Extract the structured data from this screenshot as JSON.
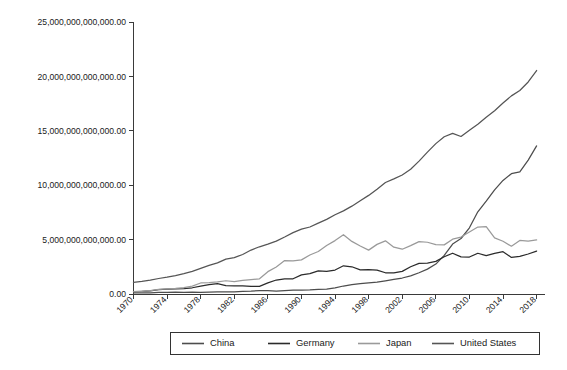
{
  "chart_data": {
    "type": "line",
    "title": "",
    "subtitle": "",
    "xlabel": "",
    "ylabel": "",
    "grid": false,
    "legend_position": "bottom",
    "xlim": [
      1970,
      2019
    ],
    "ylim": [
      0,
      25000000000000
    ],
    "ytick_labels": [
      "0.00",
      "5,000,000,000,000.00",
      "10,000,000,000,000.00",
      "15,000,000,000,000.00",
      "20,000,000,000,000.00",
      "25,000,000,000,000.00"
    ],
    "ytick_values": [
      0,
      5000000000000,
      10000000000000,
      15000000000000,
      20000000000000,
      25000000000000
    ],
    "xtick_labels": [
      "1970",
      "1974",
      "1978",
      "1982",
      "1986",
      "1990",
      "1994",
      "1998",
      "2002",
      "2006",
      "2010",
      "2014",
      "2018"
    ],
    "xtick_values": [
      1970,
      1974,
      1978,
      1982,
      1986,
      1990,
      1994,
      1998,
      2002,
      2006,
      2010,
      2014,
      2018
    ],
    "x": [
      1970,
      1971,
      1972,
      1973,
      1974,
      1975,
      1976,
      1977,
      1978,
      1979,
      1980,
      1981,
      1982,
      1983,
      1984,
      1985,
      1986,
      1987,
      1988,
      1989,
      1990,
      1991,
      1992,
      1993,
      1994,
      1995,
      1996,
      1997,
      1998,
      1999,
      2000,
      2001,
      2002,
      2003,
      2004,
      2005,
      2006,
      2007,
      2008,
      2009,
      2010,
      2011,
      2012,
      2013,
      2014,
      2015,
      2016,
      2017,
      2018
    ],
    "series": [
      {
        "name": "China",
        "color": "#4d4d4d",
        "values": [
          92603000000,
          99800000000,
          113700000000,
          138500000000,
          144200000000,
          163400000000,
          153900000000,
          174900000000,
          149500000000,
          178300000000,
          191100000000,
          195900000000,
          205100000000,
          230700000000,
          259900000000,
          309500000000,
          300800000000,
          272900000000,
          312400000000,
          347800000000,
          360900000000,
          383400000000,
          426900000000,
          444700000000,
          564300000000,
          734500000000,
          863700000000,
          961600000000,
          1029000000000,
          1094000000000,
          1211000000000,
          1339000000000,
          1470000000000,
          1660000000000,
          1955000000000,
          2286000000000,
          2752000000000,
          3550000000000,
          4594000000000,
          5102000000000,
          6087000000000,
          7552000000000,
          8532000000000,
          9570000000000,
          10440000000000,
          11060000000000,
          11230000000000,
          12310000000000,
          13610000000000
        ]
      },
      {
        "name": "Germany",
        "color": "#2b2b2b",
        "values": [
          215800000000,
          250200000000,
          298200000000,
          400300000000,
          446000000000,
          482000000000,
          501500000000,
          573900000000,
          717500000000,
          853100000000,
          946700000000,
          779000000000,
          740600000000,
          738700000000,
          692100000000,
          702000000000,
          1016000000000,
          1284000000000,
          1396000000000,
          1401000000000,
          1764000000000,
          1869000000000,
          2132000000000,
          2071000000000,
          2205000000000,
          2594000000000,
          2504000000000,
          2218000000000,
          2242000000000,
          2200000000000,
          1950000000000,
          1950000000000,
          2079000000000,
          2506000000000,
          2819000000000,
          2846000000000,
          2995000000000,
          3426000000000,
          3745000000000,
          3412000000000,
          3396000000000,
          3744000000000,
          3527000000000,
          3733000000000,
          3890000000000,
          3360000000000,
          3467000000000,
          3677000000000,
          3948000000000
        ]
      },
      {
        "name": "Japan",
        "color": "#9a9a9a",
        "values": [
          212600000000,
          240500000000,
          317100000000,
          432600000000,
          479200000000,
          521500000000,
          586100000000,
          721400000000,
          1014000000000,
          1038000000000,
          1105000000000,
          1218000000000,
          1129000000000,
          1244000000000,
          1318000000000,
          1399000000000,
          2052000000000,
          2485000000000,
          3072000000000,
          3054000000000,
          3133000000000,
          3585000000000,
          3908000000000,
          4455000000000,
          4907000000000,
          5449000000000,
          4834000000000,
          4415000000000,
          4032000000000,
          4562000000000,
          4888000000000,
          4303000000000,
          4115000000000,
          4446000000000,
          4816000000000,
          4756000000000,
          4530000000000,
          4515000000000,
          5038000000000,
          5231000000000,
          5700000000000,
          6157000000000,
          6203000000000,
          5156000000000,
          4850000000000,
          4390000000000,
          4927000000000,
          4867000000000,
          4971000000000
        ]
      },
      {
        "name": "United States",
        "color": "#555555",
        "values": [
          1073000000000,
          1165000000000,
          1279000000000,
          1425000000000,
          1545000000000,
          1685000000000,
          1873000000000,
          2082000000000,
          2352000000000,
          2627000000000,
          2857000000000,
          3207000000000,
          3344000000000,
          3634000000000,
          4038000000000,
          4339000000000,
          4580000000000,
          4855000000000,
          5236000000000,
          5642000000000,
          5963000000000,
          6158000000000,
          6520000000000,
          6859000000000,
          7287000000000,
          7640000000000,
          8073000000000,
          8578000000000,
          9063000000000,
          9631000000000,
          10250000000000,
          10580000000000,
          10940000000000,
          11460000000000,
          12210000000000,
          13040000000000,
          13820000000000,
          14450000000000,
          14770000000000,
          14480000000000,
          15050000000000,
          15600000000000,
          16250000000000,
          16840000000000,
          17550000000000,
          18210000000000,
          18700000000000,
          19490000000000,
          20540000000000
        ]
      }
    ],
    "legend": [
      {
        "label": "China",
        "color": "#4d4d4d"
      },
      {
        "label": "Germany",
        "color": "#2b2b2b"
      },
      {
        "label": "Japan",
        "color": "#9a9a9a"
      },
      {
        "label": "United States",
        "color": "#555555"
      }
    ]
  }
}
